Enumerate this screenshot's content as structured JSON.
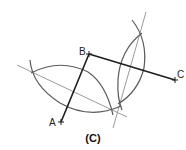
{
  "figure": {
    "caption": "(C)",
    "points": [
      {
        "label": "A",
        "x": 61,
        "y": 122
      },
      {
        "label": "B",
        "x": 89,
        "y": 54
      },
      {
        "label": "C",
        "x": 175,
        "y": 80
      }
    ],
    "segments": [
      {
        "from": "A",
        "to": "B"
      },
      {
        "from": "B",
        "to": "C"
      }
    ],
    "constructions": [
      {
        "type": "arc-lens",
        "description": "Intersecting arcs for perpendicular bisector of AB"
      },
      {
        "type": "arc-lens",
        "description": "Intersecting arcs for perpendicular bisector of BC"
      },
      {
        "type": "line",
        "description": "Perpendicular bisector of AB"
      },
      {
        "type": "line",
        "description": "Perpendicular bisector of BC"
      }
    ],
    "colors": {
      "segment": "#222222",
      "arc": "#666666",
      "bisector": "#999999"
    }
  }
}
